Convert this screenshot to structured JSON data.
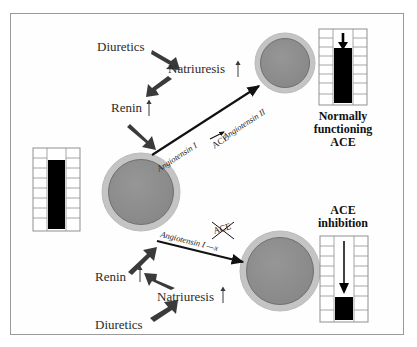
{
  "figure": {
    "background_color": "#ffffff",
    "frame_color": "#9a9a9a",
    "organ_fill_color": "#8c8c8c",
    "organ_ring_color": "#bdbdbd",
    "bar_color": "#000000",
    "text_color": "#2b2b2b"
  },
  "top_pathway": {
    "diuretics_label": "Diuretics",
    "natriuresis_label": "Natriuresis",
    "natriuresis_arrow": "↑",
    "renin_label": "Renin",
    "renin_arrow": "↑",
    "angiotensin_i_label": "Angiotensin I",
    "ace_label": "ACE",
    "angiotensin_ii_label": "Angiotensin II"
  },
  "bottom_pathway": {
    "diuretics_label": "Diuretics",
    "natriuresis_label": "Natriuresis",
    "natriuresis_arrow": "↑",
    "renin_label": "Renin",
    "renin_arrow": "↑",
    "angiotensin_i_blocked_label": "Angiotensin I —x",
    "ace_blocked_label": "ACE"
  },
  "gauges": {
    "left": {
      "name": "baseline-gauge",
      "bar_fill_percent": 78,
      "has_arrow": false,
      "caption": "",
      "tick_count": 8
    },
    "top_right": {
      "name": "normal-ace-gauge",
      "bar_fill_percent": 72,
      "has_arrow": true,
      "arrow_direction": "down",
      "arrow_length": "short",
      "caption": "Normally\nfunctioning\nACE",
      "tick_count": 8
    },
    "bottom_right": {
      "name": "ace-inhibition-gauge",
      "bar_fill_percent": 24,
      "has_arrow": true,
      "arrow_direction": "down",
      "arrow_length": "long",
      "caption": "ACE\ninhibition",
      "tick_count": 8
    }
  },
  "organs": [
    {
      "name": "kidney-baseline",
      "cx": 141,
      "cy": 192,
      "r": 39
    },
    {
      "name": "kidney-normal-ace",
      "cx": 285,
      "cy": 63,
      "r": 30
    },
    {
      "name": "kidney-ace-inhibited",
      "cx": 280,
      "cy": 271,
      "r": 40
    }
  ]
}
